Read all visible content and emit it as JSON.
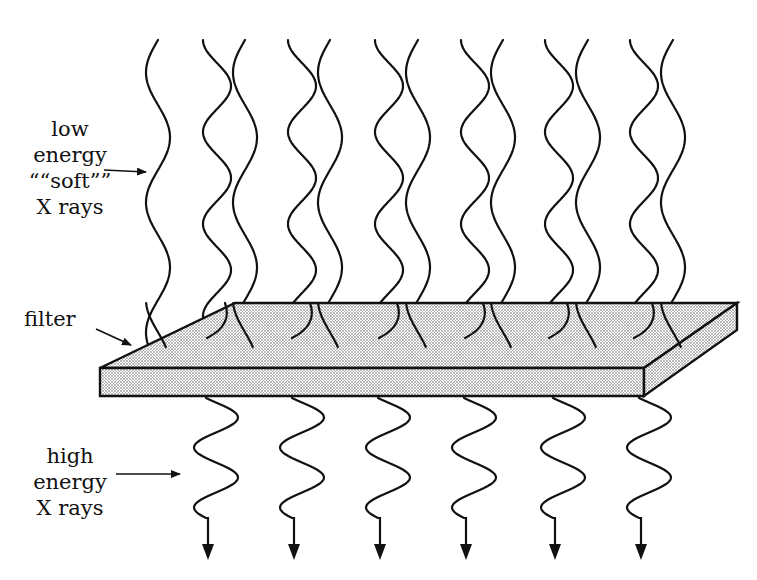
{
  "diagram": {
    "labels": {
      "soft": [
        "low",
        "energy",
        "““soft””",
        "X rays"
      ],
      "filter": "filter",
      "hard": [
        "high",
        "energy",
        "X rays"
      ]
    },
    "colors": {
      "stroke": "#111111",
      "background": "#ffffff",
      "filter_fill": "#d8d8d8"
    },
    "filter_slab": {
      "top_face": [
        [
          100,
          368
        ],
        [
          235,
          303
        ],
        [
          737,
          303
        ],
        [
          644,
          368
        ]
      ],
      "front_face": [
        [
          100,
          368
        ],
        [
          644,
          368
        ],
        [
          644,
          396
        ],
        [
          100,
          396
        ]
      ],
      "side_face": [
        [
          644,
          368
        ],
        [
          737,
          303
        ],
        [
          737,
          330
        ],
        [
          644,
          396
        ]
      ]
    },
    "incident_waves": {
      "description": "mixed beam above filter: alternating long-wavelength (soft) and short-wavelength (hard) wavy rays",
      "count": 16,
      "long_wave_x": [
        150,
        237,
        322,
        410,
        495,
        580,
        665
      ],
      "short_wave_x": [
        205,
        290,
        377,
        463,
        547,
        632
      ]
    },
    "transmitted_waves": {
      "description": "only high-energy rays exit below filter, each ending in a down arrow",
      "x": [
        208,
        294,
        380,
        466,
        555,
        641
      ],
      "count": 6
    },
    "pointer_arrows": [
      {
        "name": "soft-pointer",
        "from": [
          104,
          170
        ],
        "to": [
          146,
          172
        ]
      },
      {
        "name": "filter-pointer",
        "from": [
          96,
          329
        ],
        "to": [
          131,
          345
        ]
      },
      {
        "name": "hard-pointer",
        "from": [
          116,
          474
        ],
        "to": [
          180,
          474
        ]
      }
    ]
  }
}
